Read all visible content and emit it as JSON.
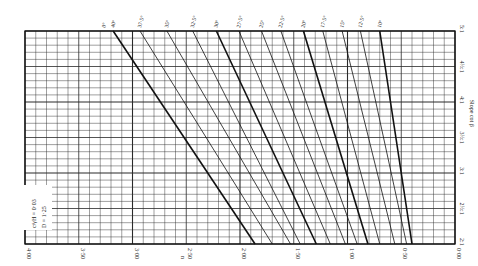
{
  "chart_data": {
    "type": "line",
    "title": "",
    "xlabel": "n",
    "ylabel": "Slope cot β",
    "xlim": [
      4.0,
      0.0
    ],
    "ylim": [
      2,
      5
    ],
    "x_ticks": [
      "4·00",
      "3·50",
      "3·00",
      "2·50",
      "2·00",
      "1·50",
      "1·00",
      "0·50",
      "0·00"
    ],
    "x_tick_values": [
      4.0,
      3.5,
      3.0,
      2.5,
      2.0,
      1.5,
      1.0,
      0.5,
      0.0
    ],
    "y_ticks": [
      "2:1",
      "2½:1",
      "3:1",
      "3½:1",
      "4:1",
      "4½:1",
      "5:1"
    ],
    "y_tick_values": [
      2,
      2.5,
      3,
      3.5,
      4,
      4.5,
      5
    ],
    "grid": true,
    "legend": {
      "position": "lower-left",
      "entries": [
        "c/γH = 0·03",
        "D = 1·25"
      ]
    },
    "series": [
      {
        "name": "φ = 40°",
        "label": "40°",
        "x": [
          3.18,
          1.86
        ],
        "y": [
          5,
          2
        ],
        "bold": true
      },
      {
        "name": "φ = 37.5°",
        "label": "37·5°",
        "x": [
          2.93,
          1.7
        ],
        "y": [
          5,
          2
        ],
        "bold": false
      },
      {
        "name": "φ = 35°",
        "label": "35°",
        "x": [
          2.68,
          1.53
        ],
        "y": [
          5,
          2
        ],
        "bold": false
      },
      {
        "name": "φ = 32.5°",
        "label": "32·5°",
        "x": [
          2.44,
          1.44
        ],
        "y": [
          5,
          2
        ],
        "bold": false
      },
      {
        "name": "φ = 30°",
        "label": "30°",
        "x": [
          2.22,
          1.29
        ],
        "y": [
          5,
          2
        ],
        "bold": true
      },
      {
        "name": "φ = 27.5°",
        "label": "27·5°",
        "x": [
          2.01,
          1.16
        ],
        "y": [
          5,
          2
        ],
        "bold": false
      },
      {
        "name": "φ = 25°",
        "label": "25°",
        "x": [
          1.8,
          1.02
        ],
        "y": [
          5,
          2
        ],
        "bold": false
      },
      {
        "name": "φ = 22.5°",
        "label": "22·5°",
        "x": [
          1.62,
          0.91
        ],
        "y": [
          5,
          2
        ],
        "bold": false
      },
      {
        "name": "φ = 20°",
        "label": "20°",
        "x": [
          1.41,
          0.81
        ],
        "y": [
          5,
          2
        ],
        "bold": true
      },
      {
        "name": "φ = 17.5°",
        "label": "17·5°",
        "x": [
          1.23,
          0.7
        ],
        "y": [
          5,
          2
        ],
        "bold": false
      },
      {
        "name": "φ = 15°",
        "label": "15°",
        "x": [
          1.05,
          0.56
        ],
        "y": [
          5,
          2
        ],
        "bold": false
      },
      {
        "name": "φ = 12.5°",
        "label": "12·5°",
        "x": [
          0.88,
          0.45
        ],
        "y": [
          5,
          2
        ],
        "bold": false
      },
      {
        "name": "φ = 10°",
        "label": "10°",
        "x": [
          0.7,
          0.4
        ],
        "y": [
          5,
          2
        ],
        "bold": true
      }
    ],
    "annotations": [
      "0°"
    ]
  },
  "labels": {
    "x_axis_title": "n",
    "y_axis_title": "Slope cot β",
    "legend_line1": "c/γH = 0·03",
    "legend_line2": "D = 1·25",
    "zero_label": "0°"
  },
  "colors": {
    "grid": "#2a2a2a",
    "curve": "#111111",
    "background": "#ffffff"
  }
}
